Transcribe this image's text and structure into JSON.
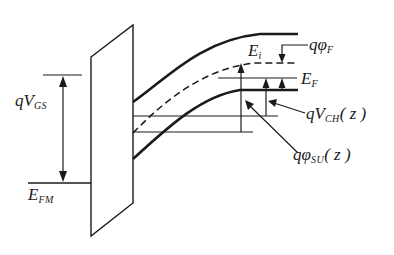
{
  "diagram": {
    "labels": {
      "qVGS": {
        "main": "qV",
        "sub": "GS"
      },
      "EFM": {
        "main": "E",
        "sub": "FM"
      },
      "Ei": {
        "main": "E",
        "sub": "i"
      },
      "qphiF": {
        "main": "qφ",
        "sub": "F"
      },
      "EF": {
        "main": "E",
        "sub": "F"
      },
      "qVCH": {
        "main": "qV",
        "sub": "CH",
        "tail": "( z )"
      },
      "qphiSU": {
        "main": "qφ",
        "sub": "SU",
        "tail": "( z )"
      }
    },
    "colors": {
      "line": "#1a1a1a",
      "background": "#ffffff"
    }
  }
}
